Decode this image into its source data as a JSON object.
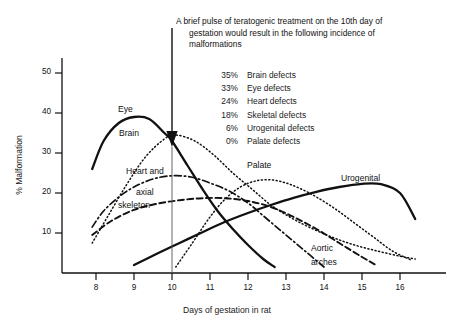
{
  "annotation": {
    "line1": "A brief pulse of teratogenic treatment on the 10th day of",
    "line2": "gestation would result in the following incidence of",
    "line3": "malformations"
  },
  "defect_table": [
    {
      "pct": "35%",
      "label": "Brain defects"
    },
    {
      "pct": "33%",
      "label": "Eye defects"
    },
    {
      "pct": "24%",
      "label": "Heart defects"
    },
    {
      "pct": "18%",
      "label": "Skeletal defects"
    },
    {
      "pct": "6%",
      "label": "Urogenital defects"
    },
    {
      "pct": "0%",
      "label": "Palate defects"
    }
  ],
  "curve_labels": {
    "eye": "Eye",
    "brain": "Brain",
    "heart1": "Heart and",
    "heart2": "axial",
    "heart3": "skeleton",
    "palate": "Palate",
    "urogenital": "Urogenital",
    "aortic1": "Aortic",
    "aortic2": "arches"
  },
  "axes": {
    "x_label": "Days of gestation in rat",
    "y_label": "% Malformation",
    "x_ticks": [
      "8",
      "9",
      "10",
      "11",
      "12",
      "13",
      "14",
      "15",
      "16"
    ],
    "y_ticks": [
      "50",
      "40",
      "30",
      "20",
      "10"
    ]
  },
  "colors": {
    "ink": "#111111",
    "background": "#ffffff"
  },
  "chart_data": {
    "type": "line",
    "title": "",
    "xlabel": "Days of gestation in rat",
    "ylabel": "% Malformation",
    "xlim": [
      7.4,
      16.6
    ],
    "ylim": [
      0,
      56
    ],
    "grid": false,
    "legend": "inline-labels",
    "annotation_text": "A brief pulse of teratogenic treatment on the 10th day of gestation would result in the following incidence of malformations",
    "marker_line": {
      "x": 10,
      "style": "arrow-down",
      "y_tip": 35
    },
    "readout_at_day_10": [
      {
        "organ": "Brain",
        "percent": 35
      },
      {
        "organ": "Eye",
        "percent": 33
      },
      {
        "organ": "Heart",
        "percent": 24
      },
      {
        "organ": "Skeletal",
        "percent": 18
      },
      {
        "organ": "Urogenital",
        "percent": 6
      },
      {
        "organ": "Palate",
        "percent": 0
      }
    ],
    "series": [
      {
        "name": "Eye",
        "style": "solid",
        "x": [
          7.9,
          8.2,
          8.6,
          9.0,
          9.4,
          9.8,
          10.0,
          10.4,
          10.8,
          11.2,
          11.6,
          12.0,
          12.4,
          12.7
        ],
        "values": [
          26,
          33,
          37.5,
          39,
          38.5,
          35,
          33,
          27,
          21,
          15.5,
          11,
          7,
          3.5,
          1.5
        ]
      },
      {
        "name": "Brain",
        "style": "dotted",
        "x": [
          7.9,
          8.3,
          8.8,
          9.3,
          9.8,
          10.1,
          10.6,
          11.1,
          11.6,
          12.1,
          12.6,
          13.1,
          13.6,
          14.2,
          14.8,
          15.4,
          16.0,
          16.4
        ],
        "values": [
          7.5,
          14,
          22,
          29,
          33.5,
          34.5,
          33,
          29.5,
          25,
          21,
          17,
          14,
          11.5,
          9,
          7,
          5.5,
          4.2,
          3.5
        ]
      },
      {
        "name": "Heart and axial skeleton",
        "style": "dash-dot",
        "x": [
          7.9,
          8.2,
          8.6,
          9.0,
          9.5,
          10.0,
          10.5,
          11.0,
          11.5,
          12.0,
          12.5,
          13.0,
          13.5,
          14.0
        ],
        "values": [
          11.5,
          15.5,
          19,
          21.5,
          23.5,
          24.3,
          24,
          22.5,
          20.5,
          17.5,
          13.5,
          9.5,
          5.5,
          1.5
        ]
      },
      {
        "name": "Skeletal",
        "style": "dashed",
        "x": [
          7.9,
          8.4,
          9.0,
          9.6,
          10.2,
          10.8,
          11.4,
          12.0,
          12.6,
          13.2,
          13.8,
          14.4,
          15.0,
          15.4
        ],
        "values": [
          9.5,
          13,
          15.8,
          17.3,
          18.2,
          18.7,
          18.7,
          18,
          16.5,
          14,
          11,
          7.5,
          4,
          1.8
        ]
      },
      {
        "name": "Palate",
        "style": "dotted",
        "x": [
          10.1,
          10.5,
          11.0,
          11.4,
          11.8,
          12.2,
          12.6,
          13.0,
          13.4,
          13.8,
          14.3,
          14.8,
          15.3,
          15.8,
          16.3
        ],
        "values": [
          1.5,
          7,
          14,
          18.5,
          21.5,
          23,
          23.3,
          22.5,
          21,
          19,
          16,
          12.5,
          9,
          5.5,
          3.2
        ]
      },
      {
        "name": "Urogenital",
        "style": "solid",
        "x": [
          9.0,
          9.6,
          10.2,
          10.8,
          11.4,
          12.0,
          12.6,
          13.2,
          13.8,
          14.4,
          15.0,
          15.5,
          16.0,
          16.4
        ],
        "values": [
          2.0,
          4.8,
          7.5,
          10.2,
          12.8,
          15.0,
          17.0,
          18.8,
          20.3,
          21.5,
          22.3,
          22.2,
          20.0,
          13.5
        ]
      }
    ]
  }
}
